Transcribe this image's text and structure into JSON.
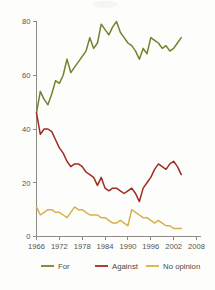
{
  "chart_data": {
    "type": "line",
    "title": "",
    "xlabel": "",
    "ylabel": "",
    "xlim": [
      1966,
      2008
    ],
    "ylim": [
      0,
      80
    ],
    "grid": false,
    "legend_position": "bottom",
    "xticks": [
      "1966",
      "1972",
      "1978",
      "1984",
      "1990",
      "1996",
      "2002",
      "2008"
    ],
    "xtick_values": [
      1966,
      1972,
      1978,
      1984,
      1990,
      1996,
      2002,
      2008
    ],
    "yticks": [
      "0",
      "20",
      "40",
      "60",
      "80"
    ],
    "ytick_values": [
      0,
      20,
      40,
      60,
      80
    ],
    "x": [
      1966,
      1967,
      1968,
      1969,
      1970,
      1971,
      1972,
      1973,
      1974,
      1975,
      1976,
      1977,
      1978,
      1979,
      1980,
      1981,
      1982,
      1983,
      1984,
      1985,
      1986,
      1987,
      1988,
      1989,
      1990,
      1991,
      1992,
      1993,
      1994,
      1995,
      1996,
      1997,
      1998,
      1999,
      2000,
      2001,
      2002,
      2003,
      2004
    ],
    "series": [
      {
        "name": "For",
        "color": "#78802c",
        "values": [
          46,
          54,
          51,
          49,
          53,
          58,
          57,
          60,
          66,
          61,
          63,
          65,
          67,
          69,
          74,
          70,
          72,
          79,
          77,
          75,
          78,
          80,
          76,
          74,
          72,
          71,
          69,
          66,
          70,
          68,
          74,
          73,
          72,
          70,
          71,
          69,
          70,
          72,
          74
        ]
      },
      {
        "name": "Against",
        "color": "#9e2c22",
        "values": [
          46,
          38,
          40,
          40,
          39,
          36,
          33,
          31,
          28,
          26,
          27,
          27,
          26,
          24,
          23,
          22,
          19,
          22,
          18,
          17,
          18,
          18,
          17,
          16,
          17,
          18,
          16,
          13,
          18,
          20,
          22,
          25,
          27,
          26,
          25,
          27,
          28,
          26,
          23
        ]
      },
      {
        "name": "No opinion",
        "color": "#d9b04a",
        "values": [
          11,
          8,
          9,
          10,
          10,
          9,
          9,
          8,
          7,
          9,
          11,
          10,
          10,
          9,
          8,
          8,
          8,
          7,
          7,
          6,
          5,
          5,
          6,
          5,
          4,
          10,
          9,
          8,
          7,
          7,
          6,
          5,
          6,
          5,
          4,
          4,
          3,
          3,
          3
        ]
      }
    ]
  },
  "legend": {
    "items": [
      {
        "label": "For",
        "color": "#78802c"
      },
      {
        "label": "Against",
        "color": "#9e2c22"
      },
      {
        "label": "No opinion",
        "color": "#d9b04a"
      }
    ]
  }
}
